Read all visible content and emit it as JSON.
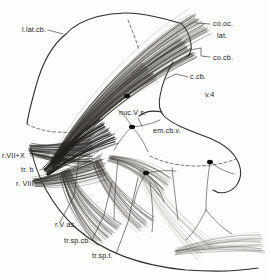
{
  "figure": {
    "kind": "anatomical-line-drawing",
    "background_color": "#fdfdfb",
    "ink_color": "#2e2b28",
    "width": 269,
    "height": 280
  },
  "labels": [
    {
      "id": "l-lat-cb",
      "text": "l.lat.cb.",
      "name": "label-l-lat-cb",
      "x": 22,
      "y": 32,
      "anchor": "start"
    },
    {
      "id": "co-oc-lat-1",
      "text": "co.oc.",
      "name": "label-co-oc-lat-line1",
      "x": 213,
      "y": 26,
      "anchor": "start"
    },
    {
      "id": "co-oc-lat-2",
      "text": "lat.",
      "name": "label-co-oc-lat-line2",
      "x": 217,
      "y": 38,
      "anchor": "start"
    },
    {
      "id": "co-cb",
      "text": "co.cb.",
      "name": "label-co-cb",
      "x": 213,
      "y": 60,
      "anchor": "start"
    },
    {
      "id": "c-cb",
      "text": "c.cb.",
      "name": "label-c-cb",
      "x": 190,
      "y": 79,
      "anchor": "start"
    },
    {
      "id": "v-4",
      "text": "v.4",
      "name": "label-v-4",
      "x": 205,
      "y": 97,
      "anchor": "start"
    },
    {
      "id": "nuc-v-s",
      "text": "nuc.V s.",
      "name": "label-nuc-v-s",
      "x": 119,
      "y": 115,
      "anchor": "start"
    },
    {
      "id": "em-cb-v",
      "text": "em.cb.v.",
      "name": "label-em-cb-v",
      "x": 153,
      "y": 133,
      "anchor": "start"
    },
    {
      "id": "r-vii-x",
      "text": "r.VII+X",
      "name": "label-r-vii-x",
      "x": 2,
      "y": 158,
      "anchor": "start"
    },
    {
      "id": "tr-b",
      "text": "tr. b",
      "name": "label-tr-b",
      "x": 21,
      "y": 172,
      "anchor": "start"
    },
    {
      "id": "r-viii",
      "text": "r. VIII",
      "name": "label-r-viii",
      "x": 16,
      "y": 186,
      "anchor": "start"
    },
    {
      "id": "r-v-as",
      "text": "r.V as.",
      "name": "label-r-v-as",
      "x": 55,
      "y": 227,
      "anchor": "start"
    },
    {
      "id": "tr-sp-cb",
      "text": "tr.sp.cb.",
      "name": "label-tr-sp-cb",
      "x": 64,
      "y": 243,
      "anchor": "start"
    },
    {
      "id": "tr-sp-t",
      "text": "tr.sp.t.",
      "name": "label-tr-sp-t",
      "x": 92,
      "y": 258,
      "anchor": "start"
    }
  ],
  "leaders": [
    {
      "name": "leader-l-lat-cb",
      "d": "M 48 30 L 63 34"
    },
    {
      "name": "leader-co-oc-lat",
      "d": "M 210 24 L 196 23"
    },
    {
      "name": "leader-co-cb",
      "d": "M 210 57 L 201 56 L 201 48 L 190 50"
    },
    {
      "name": "leader-c-cb",
      "d": "M 188 77 L 176 74 L 166 79"
    },
    {
      "name": "leader-nuc-v-s",
      "d": "M 138 118 L 142 126"
    },
    {
      "name": "leader-r-vii-x",
      "d": "M 36 155 L 49 155"
    },
    {
      "name": "leader-tr-b",
      "d": "M 40 170 L 52 166"
    },
    {
      "name": "leader-r-viii",
      "d": "M 40 183 L 54 175"
    },
    {
      "name": "leader-r-v-as",
      "d": "M 60 222 L 74 196 L 80 150"
    },
    {
      "name": "leader-tr-sp-cb",
      "d": "M 92 240 L 104 215 L 112 182"
    },
    {
      "name": "leader-tr-sp-t",
      "d": "M 116 254 L 128 222 L 138 178"
    }
  ],
  "outlines": [
    {
      "name": "cerebellum-outer-contour",
      "d": "M 66 34 C 80 18 112 10 140 14 C 160 17 172 21 180 23"
    },
    {
      "name": "cerebellum-left-border",
      "d": "M 66 34 C 52 45 42 64 36 86 C 31 104 28 116 27 124"
    },
    {
      "name": "lower-body-contour",
      "d": "M 31 148 C 36 176 52 206 76 228 C 104 253 144 266 186 270 C 214 272 240 271 258 268"
    },
    {
      "name": "co-cb-contour",
      "d": "M 181 23 C 186 28 190 36 191 44 C 192 50 190 54 187 57"
    },
    {
      "name": "ventricle-v4-contour",
      "d": "M 173 62 C 167 72 162 84 160 96 C 158 106 160 112 164 116 C 172 124 188 130 204 136 C 218 141 230 148 236 158 C 242 168 242 178 236 186 C 230 193 220 195 213 190"
    },
    {
      "name": "ventricle-roof-left",
      "d": "M 162 112 C 152 110 144 112 139 116"
    }
  ],
  "dashed_outlines": [
    {
      "name": "dashed-fissure-upper",
      "d": "M 128 20 C 132 30 136 40 139 50"
    },
    {
      "name": "dashed-fissure-left",
      "d": "M 27 124 C 34 128 44 131 56 132 C 70 133 84 132 96 128"
    },
    {
      "name": "dashed-fissure-lower-right",
      "d": "M 150 156 C 162 162 178 166 196 166 C 212 166 226 163 236 159"
    }
  ],
  "soma_points": [
    {
      "name": "soma-cerebellar-cortex",
      "cx": 127,
      "cy": 96,
      "r": 2.6
    },
    {
      "name": "soma-nuc-v-s",
      "cx": 132,
      "cy": 127,
      "r": 2.6
    },
    {
      "name": "soma-lower-mid",
      "cx": 146,
      "cy": 173,
      "r": 2.6
    },
    {
      "name": "soma-right-lateral",
      "cx": 210,
      "cy": 162,
      "r": 2.6
    }
  ],
  "fiber_bundles": [
    {
      "name": "bundle-co-oc-lat-upper",
      "color": "#3c3936",
      "origin": [
        56,
        160
      ],
      "target": [
        200,
        22
      ],
      "count": 46,
      "spread": 13,
      "curve": -28,
      "width": 0.45,
      "opacity": 0.72
    },
    {
      "name": "bundle-co-cb-main",
      "color": "#33302d",
      "origin": [
        54,
        162
      ],
      "target": [
        188,
        48
      ],
      "count": 52,
      "spread": 11,
      "curve": -20,
      "width": 0.5,
      "opacity": 0.78
    },
    {
      "name": "bundle-mid-ascending",
      "color": "#3a3734",
      "origin": [
        52,
        166
      ],
      "target": [
        150,
        72
      ],
      "count": 44,
      "spread": 10,
      "curve": -14,
      "width": 0.5,
      "opacity": 0.7
    },
    {
      "name": "bundle-entry-dense-core",
      "color": "#1a1917",
      "origin": [
        46,
        172
      ],
      "target": [
        108,
        130
      ],
      "count": 56,
      "spread": 14,
      "curve": -6,
      "width": 0.62,
      "opacity": 0.9
    },
    {
      "name": "bundle-r-vii-x-entry",
      "color": "#242220",
      "origin": [
        30,
        150
      ],
      "target": [
        92,
        152
      ],
      "count": 40,
      "spread": 16,
      "curve": 5,
      "width": 0.55,
      "opacity": 0.82
    },
    {
      "name": "bundle-r-viii-entry",
      "color": "#2a2825",
      "origin": [
        34,
        182
      ],
      "target": [
        104,
        166
      ],
      "count": 34,
      "spread": 12,
      "curve": 6,
      "width": 0.5,
      "opacity": 0.78
    },
    {
      "name": "bundle-tr-sp-cb-descending",
      "color": "#35322f",
      "origin": [
        64,
        172
      ],
      "target": [
        108,
        236
      ],
      "count": 42,
      "spread": 16,
      "curve": 12,
      "width": 0.5,
      "opacity": 0.72
    },
    {
      "name": "bundle-tr-sp-t-descending",
      "color": "#3a3734",
      "origin": [
        96,
        162
      ],
      "target": [
        146,
        224
      ],
      "count": 30,
      "spread": 12,
      "curve": 10,
      "width": 0.45,
      "opacity": 0.66
    },
    {
      "name": "bundle-r-v-as-lower",
      "color": "#403d39",
      "origin": [
        110,
        158
      ],
      "target": [
        166,
        186
      ],
      "count": 30,
      "spread": 11,
      "curve": -10,
      "width": 0.45,
      "opacity": 0.64
    },
    {
      "name": "bundle-em-cb-v-sparse",
      "color": "#55514d",
      "origin": [
        140,
        170
      ],
      "target": [
        206,
        250
      ],
      "count": 16,
      "spread": 14,
      "curve": 10,
      "width": 0.4,
      "opacity": 0.5
    },
    {
      "name": "bundle-lower-right-horizontal",
      "color": "#4a4642",
      "origin": [
        176,
        252
      ],
      "target": [
        262,
        244
      ],
      "count": 20,
      "spread": 9,
      "curve": -6,
      "width": 0.45,
      "opacity": 0.6
    }
  ],
  "branch_fibers": [
    {
      "name": "branch-nuc-v-s-a",
      "d": "M 132 127 C 126 132 120 140 114 150"
    },
    {
      "name": "branch-nuc-v-s-b",
      "d": "M 132 127 C 138 133 144 142 148 152"
    },
    {
      "name": "branch-nuc-v-s-c",
      "d": "M 132 127 C 128 120 124 114 118 110"
    },
    {
      "name": "branch-nuc-v-s-d",
      "d": "M 132 127 C 142 126 152 124 160 120"
    },
    {
      "name": "branch-soma-lower-a",
      "d": "M 146 173 C 140 182 136 192 134 204"
    },
    {
      "name": "branch-soma-lower-b",
      "d": "M 146 173 C 154 180 160 190 164 202"
    },
    {
      "name": "branch-soma-lower-c",
      "d": "M 146 173 C 156 171 166 170 176 171"
    },
    {
      "name": "branch-right-lateral-a",
      "d": "M 210 162 C 208 176 206 192 206 210"
    },
    {
      "name": "branch-right-lateral-b",
      "d": "M 210 162 C 218 168 226 172 234 174"
    },
    {
      "name": "branch-right-lateral-c",
      "d": "M 206 210 C 200 222 194 232 186 240"
    },
    {
      "name": "branch-right-lateral-d",
      "d": "M 206 210 C 214 220 222 228 232 234"
    },
    {
      "name": "branch-left-descender-a",
      "d": "M 118 160 C 116 180 114 200 114 220"
    },
    {
      "name": "branch-left-descender-b",
      "d": "M 150 182 C 152 200 154 216 152 232"
    },
    {
      "name": "branch-mid-descender",
      "d": "M 172 168 C 174 186 176 204 178 220"
    }
  ]
}
